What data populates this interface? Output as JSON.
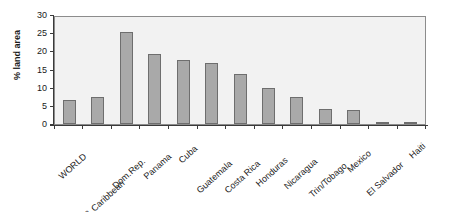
{
  "chart_data": {
    "type": "bar",
    "title": "",
    "xlabel": "",
    "ylabel": "% land area",
    "ylim": [
      0,
      30
    ],
    "yticks": [
      0,
      5,
      10,
      15,
      20,
      25,
      30
    ],
    "grid": false,
    "legend": null,
    "categories": [
      "WORLD",
      "L.Am & Caribbean",
      "Dom.Rep.",
      "Panama",
      "Cuba",
      "Guatemala",
      "Costa Rica",
      "Honduras",
      "Nicaragua",
      "Trin/Tobago",
      "Mexico",
      "El Salvador",
      "Haiti"
    ],
    "values": [
      6.7,
      7.4,
      25.3,
      19.3,
      17.5,
      16.8,
      13.9,
      10.0,
      7.4,
      4.2,
      3.9,
      0.4,
      0.4
    ],
    "colors": {
      "bar_fill": "#a9a9a9",
      "bar_border": "#6e6e6e",
      "plot_background": "#f2f2f2",
      "plot_border": "#8c8c8c",
      "axis": "#3a3a3a",
      "text": "#1a1a1a",
      "page_background": "#ffffff"
    }
  }
}
